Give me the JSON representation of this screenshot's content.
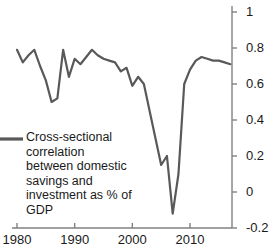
{
  "chart_data": {
    "type": "line",
    "title": "",
    "xlabel": "",
    "ylabel": "",
    "xlim": [
      1979,
      2017
    ],
    "ylim": [
      -0.2,
      1
    ],
    "grid": false,
    "y_axis_position": "right",
    "x_ticks": [
      "1980",
      "1990",
      "2000",
      "2010"
    ],
    "x_tick_values": [
      1980,
      1990,
      2000,
      2010
    ],
    "y_ticks": [
      "1",
      "0.8",
      "0.6",
      "0.4",
      "0.2",
      "0",
      "-0.2"
    ],
    "y_tick_values": [
      1,
      0.8,
      0.6,
      0.4,
      0.2,
      0,
      -0.2
    ],
    "legend_position": "inside-left",
    "series": [
      {
        "name": "Cross-sectional correlation between domestic savings and investment as % of GDP",
        "color": "#595959",
        "x": [
          1980,
          1981,
          1982,
          1983,
          1984,
          1985,
          1986,
          1987,
          1988,
          1989,
          1990,
          1991,
          1992,
          1993,
          1994,
          1995,
          1996,
          1997,
          1998,
          1999,
          2000,
          2001,
          2002,
          2003,
          2004,
          2005,
          2006,
          2007,
          2008,
          2009,
          2010,
          2011,
          2012,
          2013,
          2014,
          2015,
          2016,
          2017
        ],
        "y": [
          0.79,
          0.72,
          0.76,
          0.79,
          0.7,
          0.62,
          0.5,
          0.52,
          0.79,
          0.64,
          0.74,
          0.71,
          0.75,
          0.79,
          0.76,
          0.74,
          0.73,
          0.72,
          0.67,
          0.69,
          0.59,
          0.64,
          0.6,
          0.45,
          0.3,
          0.15,
          0.2,
          -0.12,
          0.1,
          0.6,
          0.68,
          0.73,
          0.75,
          0.74,
          0.73,
          0.73,
          0.72,
          0.71
        ]
      }
    ]
  },
  "legend": {
    "swatch_color": "#595959",
    "lines": [
      "Cross-sectional",
      "correlation",
      "between domestic",
      "savings and",
      "investment as % of",
      "GDP"
    ]
  },
  "axis": {
    "line_color": "#808080"
  }
}
